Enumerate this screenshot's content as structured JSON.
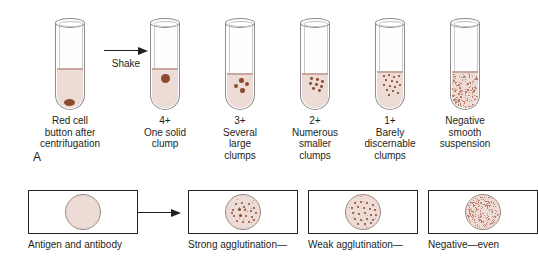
{
  "figure": {
    "panel_a": {
      "letter": "A",
      "arrow_label": "Shake",
      "tubes": [
        {
          "id": "tube-red-cell-button",
          "grade": "",
          "caption": "Red cell\nbutton after\ncentrifugation",
          "pattern": "button",
          "fluid_height_pct": 46
        },
        {
          "id": "tube-4-plus",
          "grade": "4+",
          "caption": "4+\nOne solid\nclump",
          "pattern": "one-solid-clump",
          "fluid_height_pct": 46
        },
        {
          "id": "tube-3-plus",
          "grade": "3+",
          "caption": "3+\nSeveral\nlarge\nclumps",
          "pattern": "several-large-clumps",
          "fluid_height_pct": 40
        },
        {
          "id": "tube-2-plus",
          "grade": "2+",
          "caption": "2+\nNumerous\nsmaller\nclumps",
          "pattern": "numerous-smaller-clumps",
          "fluid_height_pct": 40
        },
        {
          "id": "tube-1-plus",
          "grade": "1+",
          "caption": "1+\nBarely\ndiscernable\nclumps",
          "pattern": "barely-discernable-clumps",
          "fluid_height_pct": 42
        },
        {
          "id": "tube-negative",
          "grade": "Negative",
          "caption": "Negative\nsmooth\nsuspension",
          "pattern": "smooth-suspension",
          "fluid_height_pct": 42
        }
      ]
    },
    "panel_b": {
      "slides": [
        {
          "id": "slide-antigen-antibody",
          "caption": "Antigen and antibody",
          "pattern": "uniform"
        },
        {
          "id": "slide-strong-agglutination",
          "caption": "Strong agglutination—",
          "pattern": "large-clumps"
        },
        {
          "id": "slide-weak-agglutination",
          "caption": "Weak agglutination—",
          "pattern": "small-clumps"
        },
        {
          "id": "slide-negative",
          "caption": "Negative—even",
          "pattern": "fine-even"
        }
      ]
    },
    "colors": {
      "fluid": "#eddbd6",
      "clump": "#8c4a2f",
      "speck": "#b4705a",
      "glass": "#8d8d8d",
      "ink": "#231f20"
    }
  }
}
